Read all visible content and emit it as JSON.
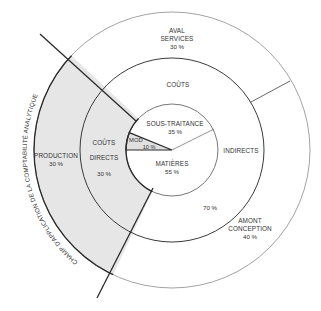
{
  "colors": {
    "background": "#ffffff",
    "shaded_region": "#e6e6e6",
    "line": "#2a2a2a",
    "thin_line": "#8a8a8a",
    "text": "#333333"
  },
  "diagram": {
    "scope_label": "CHAMP D'APPLICATION DE LA COMPTABILITÉ ANALYTIQUE",
    "outer_ring": {
      "aval": {
        "line1": "AVAL",
        "line2": "SERVICES",
        "pct": "30 %"
      },
      "production": {
        "line1": "PRODUCTION",
        "pct": "30 %"
      },
      "amont": {
        "line1": "AMONT",
        "line2": "CONCEPTION",
        "pct": "40 %"
      }
    },
    "middle_ring": {
      "couts_top": "COÛTS",
      "indirects": "INDIRECTS",
      "indirects_pct": "70 %",
      "directs_line1": "COÛTS",
      "directs_line2": "DIRECTS",
      "directs_pct": "30 %"
    },
    "inner_circle": {
      "sous_traitance": {
        "label": "SOUS-TRAITANCE",
        "pct": "35 %"
      },
      "mod": {
        "label": "MOD",
        "pct": "10 %"
      },
      "matieres": {
        "label": "MATIÈRES",
        "pct": "55 %"
      }
    }
  }
}
